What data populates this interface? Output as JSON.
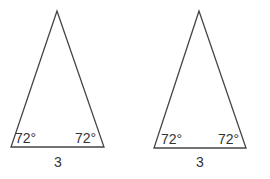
{
  "figure": {
    "stroke_color": "#444444",
    "text_color": "#333333",
    "triangles": [
      {
        "id": "left",
        "apex": [
          57,
          11
        ],
        "base_left": [
          11,
          147
        ],
        "base_right": [
          104,
          147
        ],
        "angle_left": "72°",
        "angle_right": "72°",
        "base_label": "3"
      },
      {
        "id": "right",
        "apex": [
          199,
          11
        ],
        "base_left": [
          154,
          148
        ],
        "base_right": [
          246,
          148
        ],
        "angle_left": "72°",
        "angle_right": "72°",
        "base_label": "3"
      }
    ]
  }
}
